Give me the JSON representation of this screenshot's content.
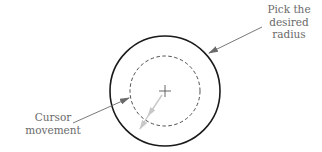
{
  "figure": {
    "labels": {
      "pick_radius": [
        "Pick the",
        "desired",
        "radius"
      ],
      "cursor_movement": [
        "Cursor",
        "movement"
      ]
    },
    "colors": {
      "outer_circle": "#1a1a1a",
      "dashed_circle": "#3a3a3a",
      "leader_arrow": "#6a6a6a",
      "movement_arrow": "#c8c8c8",
      "text": "#6a6a6a"
    },
    "geometry": {
      "center": [
        165,
        91
      ],
      "outer_radius": 55,
      "dashed_radius": 35
    }
  }
}
